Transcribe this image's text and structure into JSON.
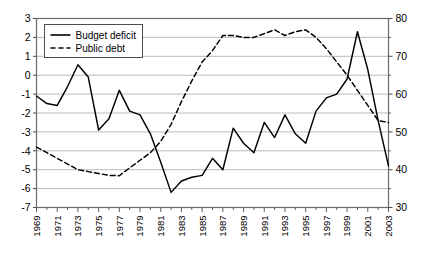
{
  "chart_data": {
    "type": "line",
    "title": "",
    "xlabel": "",
    "ylabel": "",
    "grid": true,
    "legend_position": "top-left",
    "x": [
      1969,
      1970,
      1971,
      1972,
      1973,
      1974,
      1975,
      1976,
      1977,
      1978,
      1979,
      1980,
      1981,
      1982,
      1983,
      1984,
      1985,
      1986,
      1987,
      1988,
      1989,
      1990,
      1991,
      1992,
      1993,
      1994,
      1995,
      1996,
      1997,
      1998,
      1999,
      2000,
      2001,
      2002,
      2003
    ],
    "x_tick_labels": [
      "1969",
      "1971",
      "1973",
      "1975",
      "1977",
      "1979",
      "1981",
      "1983",
      "1985",
      "1987",
      "1989",
      "1991",
      "1993",
      "1995",
      "1997",
      "1999",
      "2001",
      "2003"
    ],
    "x_tick_values": [
      1969,
      1971,
      1973,
      1975,
      1977,
      1979,
      1981,
      1983,
      1985,
      1987,
      1989,
      1991,
      1993,
      1995,
      1997,
      1999,
      2001,
      2003
    ],
    "xlim": [
      1969,
      2003
    ],
    "left_axis": {
      "ylim": [
        -7,
        3
      ],
      "ticks": [
        3,
        2,
        1,
        0,
        -1,
        -2,
        -3,
        -4,
        -5,
        -6,
        -7
      ],
      "tick_labels": [
        "3",
        "2",
        "1",
        "0",
        "-1",
        "-2",
        "-3",
        "-4",
        "-5",
        "-6",
        "-7"
      ]
    },
    "right_axis": {
      "ylim": [
        30,
        80
      ],
      "ticks": [
        80,
        70,
        60,
        50,
        40,
        30
      ],
      "tick_labels": [
        "80",
        "70",
        "60",
        "50",
        "40",
        "30"
      ],
      "minor_ticks": [
        75,
        65,
        55,
        45,
        35
      ]
    },
    "series": [
      {
        "name": "Budget deficit",
        "axis": "left",
        "style": "solid",
        "color": "#000000",
        "values": [
          -1.1,
          -1.5,
          -1.6,
          -0.6,
          0.55,
          -0.1,
          -2.9,
          -2.3,
          -0.8,
          -1.9,
          -2.1,
          -3.1,
          -4.6,
          -6.2,
          -5.6,
          -5.4,
          -5.3,
          -4.4,
          -5.0,
          -2.8,
          -3.6,
          -4.1,
          -2.5,
          -3.3,
          -2.1,
          -3.1,
          -3.6,
          -1.9,
          -1.2,
          -1.0,
          -0.2,
          2.3,
          0.3,
          -2.4,
          -4.8
        ]
      },
      {
        "name": "Public debt",
        "axis": "right",
        "style": "dashed",
        "color": "#000000",
        "values": [
          46.0,
          44.5,
          43.0,
          41.5,
          40.0,
          39.5,
          39.0,
          38.5,
          38.4,
          40.5,
          42.5,
          44.5,
          47.5,
          52.0,
          58.0,
          63.5,
          68.5,
          71.5,
          75.5,
          75.5,
          75.0,
          75.0,
          76.0,
          77.0,
          75.5,
          76.5,
          77.0,
          75.0,
          72.0,
          68.5,
          65.0,
          61.0,
          57.0,
          53.0,
          52.5
        ]
      }
    ]
  },
  "legend": {
    "items": [
      {
        "label": "Budget deficit",
        "style": "solid"
      },
      {
        "label": "Public debt",
        "style": "dashed"
      }
    ]
  }
}
